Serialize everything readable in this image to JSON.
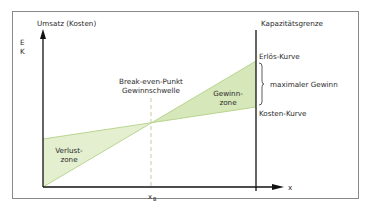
{
  "diagram": {
    "title_y_axis": "Umsatz (Kosten)",
    "y_symbols": [
      "E",
      "K"
    ],
    "x_axis_label": "x",
    "x_break_even_label": "x",
    "x_break_even_subscript": "B",
    "capacity_label": "Kapazitätsgrenze",
    "revenue_curve_label": "Erlös-Kurve",
    "cost_curve_label": "Kosten-Kurve",
    "max_profit_label": "maximaler Gewinn",
    "break_even_label_line1": "Break-even-Punkt",
    "break_even_label_line2": "Gewinnschwelle",
    "profit_zone_line1": "Gewinn-",
    "profit_zone_line2": "zone",
    "loss_zone_line1": "Verlust-",
    "loss_zone_line2": "zone",
    "colors": {
      "zone_fill": "#dfecc8",
      "zone_stroke": "#b9d58f",
      "axis": "#111111",
      "frame": "#8a8a8a",
      "dashed": "#c9c9a8"
    }
  }
}
